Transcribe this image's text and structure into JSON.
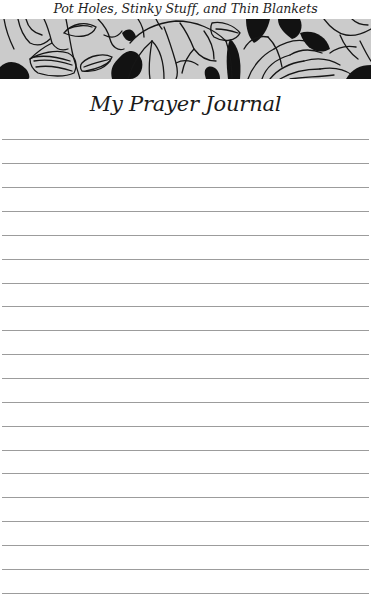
{
  "running_header": {
    "text": "Pot Holes, Stinky Stuff, and Thin Blankets"
  },
  "banner": {
    "description": "black-and-white floral line-art decorative band",
    "background_color": "#c9c9c9",
    "ink_color": "#111111"
  },
  "page": {
    "title": "My Prayer Journal"
  },
  "ruled_lines": {
    "count": 20,
    "first_y": 139,
    "spacing": 23.9,
    "color": "#9c9c9c"
  }
}
